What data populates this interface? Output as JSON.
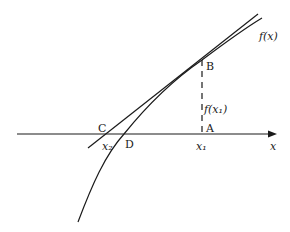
{
  "diagram": {
    "type": "newton-raphson-construction",
    "colors": {
      "ink": "#1a1a1a",
      "background": "#ffffff"
    },
    "labels": {
      "curve": "f(x)",
      "point_b": "B",
      "point_a": "A",
      "point_c": "C",
      "point_d": "D",
      "ordinate": "f(x₁)",
      "x1": "x₁",
      "x2": "x₂",
      "axis": "x"
    },
    "elements": [
      {
        "name": "x-axis",
        "kind": "arrow-line"
      },
      {
        "name": "curve-f",
        "kind": "curve"
      },
      {
        "name": "tangent-at-b",
        "kind": "line"
      },
      {
        "name": "ordinate-ab",
        "kind": "dashed-line"
      }
    ]
  }
}
